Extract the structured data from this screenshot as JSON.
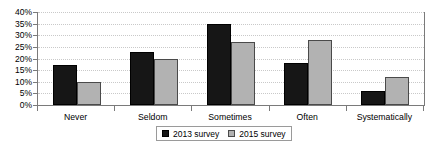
{
  "chart_data": {
    "type": "bar",
    "title": "",
    "subtitle": "",
    "xlabel": "",
    "ylabel": "",
    "categories": [
      "Never",
      "Seldom",
      "Sometimes",
      "Often",
      "Systematically"
    ],
    "series": [
      {
        "name": "2013 survey",
        "color": "#161616",
        "values": [
          17,
          23,
          35,
          18,
          6
        ]
      },
      {
        "name": "2015 survey",
        "color": "#b2b2b2",
        "values": [
          10,
          20,
          27,
          28,
          12
        ]
      }
    ],
    "ylim": [
      0,
      40
    ],
    "ytick_values": [
      0,
      5,
      10,
      15,
      20,
      25,
      30,
      35,
      40
    ],
    "ytick_labels": [
      "0%",
      "5%",
      "10%",
      "15%",
      "20%",
      "25%",
      "30%",
      "35%",
      "40%"
    ],
    "grid": true,
    "grid_axis": "y",
    "grid_style": "dotted",
    "legend_position": "bottom-center",
    "legend_entries": [
      "2013 survey",
      "2015 survey"
    ],
    "annotations": []
  }
}
